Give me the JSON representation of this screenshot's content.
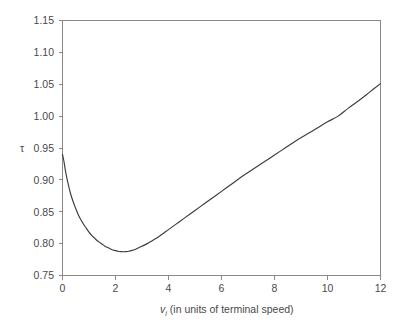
{
  "chart_data": {
    "type": "line",
    "title": "",
    "xlabel": "v_i (in units of terminal speed)",
    "xlabel_base": "v",
    "xlabel_sub": "i",
    "xlabel_rest": " (in units of terminal speed)",
    "ylabel": "τ",
    "xlim": [
      0,
      12
    ],
    "ylim": [
      0.75,
      1.15
    ],
    "grid": false,
    "legend": null,
    "xticks": [
      0,
      2,
      4,
      6,
      8,
      10,
      12
    ],
    "xtick_labels": [
      "0",
      "2",
      "4",
      "6",
      "8",
      "10",
      "12"
    ],
    "yticks": [
      0.75,
      0.8,
      0.85,
      0.9,
      0.95,
      1.0,
      1.05,
      1.1,
      1.15
    ],
    "ytick_labels": [
      "0.75",
      "0.80",
      "0.85",
      "0.90",
      "0.95",
      "1.00",
      "1.05",
      "1.10",
      "1.15"
    ],
    "series": [
      {
        "name": "tau",
        "color": "#3c3c3c",
        "x": [
          0.0,
          0.05,
          0.1,
          0.15,
          0.2,
          0.3,
          0.4,
          0.5,
          0.6,
          0.7,
          0.8,
          0.9,
          1.0,
          1.1,
          1.2,
          1.3,
          1.4,
          1.5,
          1.6,
          1.7,
          1.8,
          1.9,
          2.0,
          2.1,
          2.2,
          2.3,
          2.4,
          2.5,
          2.6,
          2.8,
          3.0,
          3.2,
          3.4,
          3.6,
          3.8,
          4.0,
          4.4,
          4.8,
          5.2,
          5.6,
          6.0,
          6.4,
          6.8,
          7.2,
          7.6,
          8.0,
          8.4,
          8.8,
          9.2,
          9.6,
          10.0,
          10.4,
          10.8,
          11.2,
          11.6,
          12.0
        ],
        "y": [
          0.94,
          0.93,
          0.917,
          0.906,
          0.896,
          0.879,
          0.866,
          0.855,
          0.845,
          0.837,
          0.83,
          0.824,
          0.818,
          0.813,
          0.809,
          0.805,
          0.802,
          0.799,
          0.796,
          0.794,
          0.792,
          0.79,
          0.789,
          0.788,
          0.7875,
          0.7873,
          0.7875,
          0.788,
          0.789,
          0.792,
          0.796,
          0.8,
          0.805,
          0.81,
          0.816,
          0.822,
          0.834,
          0.846,
          0.858,
          0.87,
          0.882,
          0.894,
          0.906,
          0.917,
          0.928,
          0.939,
          0.95,
          0.961,
          0.971,
          0.981,
          0.991,
          1.0,
          1.013,
          1.025,
          1.038,
          1.051
        ]
      }
    ],
    "annotations": []
  },
  "figure": {
    "background_color": "#ffffff",
    "frame_color": "#8a8a8a",
    "text_color": "#4a4a4a",
    "curve_color": "#3c3c3c"
  }
}
